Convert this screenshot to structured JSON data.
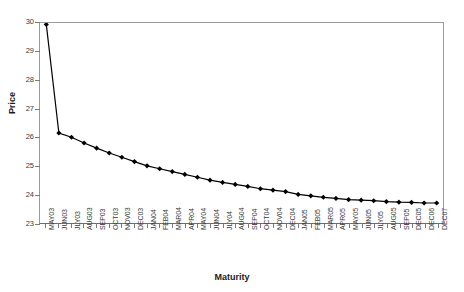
{
  "chart_data": {
    "type": "line",
    "title": "",
    "xlabel": "Maturity",
    "ylabel": "Price",
    "ylim": [
      23,
      30
    ],
    "yticks": [
      23,
      24,
      25,
      26,
      27,
      28,
      29,
      30
    ],
    "grid": false,
    "legend": null,
    "marker": "diamond",
    "line_color": "#000000",
    "marker_color": "#000000",
    "categories": [
      "MAY03",
      "JUN03",
      "JLY03",
      "AUG03",
      "SEP03",
      "OCT03",
      "NOV03",
      "DEC03",
      "JAN04",
      "FEB04",
      "MAR04",
      "APR04",
      "MAY04",
      "JUN04",
      "JLY04",
      "AUG04",
      "SEP04",
      "OCT04",
      "NOV04",
      "DEC04",
      "JAN05",
      "FEB05",
      "MAR05",
      "APR05",
      "MAY05",
      "JUN05",
      "JLY05",
      "AUG05",
      "SEP05",
      "DEC05",
      "DEC06",
      "DEC07"
    ],
    "values": [
      29.95,
      26.15,
      26.0,
      25.8,
      25.62,
      25.45,
      25.3,
      25.15,
      25.0,
      24.9,
      24.8,
      24.7,
      24.6,
      24.5,
      24.42,
      24.35,
      24.28,
      24.2,
      24.15,
      24.1,
      24.0,
      23.95,
      23.9,
      23.86,
      23.82,
      23.8,
      23.78,
      23.75,
      23.73,
      23.72,
      23.7,
      23.7
    ]
  }
}
